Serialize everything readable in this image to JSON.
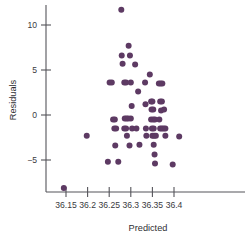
{
  "chart_data": {
    "type": "scatter",
    "title": "",
    "xlabel": "Predicted",
    "ylabel": "Residuals",
    "grid": false,
    "legend": false,
    "xlim": [
      36.13,
      36.45
    ],
    "ylim": [
      -9.0,
      12.8
    ],
    "xticks": [
      36.15,
      36.2,
      36.25,
      36.3,
      36.35,
      36.4
    ],
    "xticklabels": [
      "36.15",
      "36.2",
      "36.25",
      "36.3",
      "36.35",
      "36.4"
    ],
    "yticks": [
      10,
      5,
      0,
      -5
    ],
    "yticklabels": [
      "10",
      "5",
      "0",
      "-5"
    ],
    "marker_color": "#5d3a63",
    "marker_size": 3.0,
    "points": [
      {
        "x": 36.145,
        "y": -8.1
      },
      {
        "x": 36.198,
        "y": -2.3
      },
      {
        "x": 36.247,
        "y": -5.2
      },
      {
        "x": 36.251,
        "y": 3.6
      },
      {
        "x": 36.256,
        "y": 3.6
      },
      {
        "x": 36.259,
        "y": -0.5
      },
      {
        "x": 36.263,
        "y": -0.5
      },
      {
        "x": 36.262,
        "y": -1.5
      },
      {
        "x": 36.266,
        "y": -1.5
      },
      {
        "x": 36.264,
        "y": -3.4
      },
      {
        "x": 36.271,
        "y": -5.2
      },
      {
        "x": 36.278,
        "y": 11.7
      },
      {
        "x": 36.281,
        "y": 5.7
      },
      {
        "x": 36.279,
        "y": 6.6
      },
      {
        "x": 36.285,
        "y": 3.6
      },
      {
        "x": 36.289,
        "y": 3.6
      },
      {
        "x": 36.286,
        "y": -0.4
      },
      {
        "x": 36.29,
        "y": -0.4
      },
      {
        "x": 36.294,
        "y": -0.4
      },
      {
        "x": 36.285,
        "y": -1.5
      },
      {
        "x": 36.289,
        "y": -1.5
      },
      {
        "x": 36.291,
        "y": -2.3
      },
      {
        "x": 36.295,
        "y": 7.7
      },
      {
        "x": 36.298,
        "y": 6.6
      },
      {
        "x": 36.3,
        "y": 3.6
      },
      {
        "x": 36.302,
        "y": 1.0
      },
      {
        "x": 36.3,
        "y": -0.4
      },
      {
        "x": 36.303,
        "y": -1.5
      },
      {
        "x": 36.297,
        "y": -3.4
      },
      {
        "x": 36.31,
        "y": 5.6
      },
      {
        "x": 36.313,
        "y": -1.5
      },
      {
        "x": 36.317,
        "y": 2.6
      },
      {
        "x": 36.32,
        "y": -3.3
      },
      {
        "x": 36.333,
        "y": 3.6
      },
      {
        "x": 36.334,
        "y": 1.2
      },
      {
        "x": 36.335,
        "y": -1.5
      },
      {
        "x": 36.336,
        "y": -2.3
      },
      {
        "x": 36.344,
        "y": 4.5
      },
      {
        "x": 36.347,
        "y": 1.5
      },
      {
        "x": 36.35,
        "y": 1.5
      },
      {
        "x": 36.352,
        "y": 0.6
      },
      {
        "x": 36.348,
        "y": 0.6
      },
      {
        "x": 36.347,
        "y": -0.5
      },
      {
        "x": 36.352,
        "y": -0.5
      },
      {
        "x": 36.356,
        "y": -0.5
      },
      {
        "x": 36.349,
        "y": -1.5
      },
      {
        "x": 36.353,
        "y": -1.5
      },
      {
        "x": 36.35,
        "y": -2.3
      },
      {
        "x": 36.354,
        "y": -2.3
      },
      {
        "x": 36.358,
        "y": -2.3
      },
      {
        "x": 36.353,
        "y": -3.3
      },
      {
        "x": 36.355,
        "y": -4.4
      },
      {
        "x": 36.356,
        "y": -5.4
      },
      {
        "x": 36.365,
        "y": 3.5
      },
      {
        "x": 36.369,
        "y": 3.5
      },
      {
        "x": 36.373,
        "y": 3.5
      },
      {
        "x": 36.368,
        "y": 1.5
      },
      {
        "x": 36.372,
        "y": 1.5
      },
      {
        "x": 36.37,
        "y": 0.5
      },
      {
        "x": 36.366,
        "y": -0.5
      },
      {
        "x": 36.368,
        "y": -1.5
      },
      {
        "x": 36.372,
        "y": -1.5
      },
      {
        "x": 36.376,
        "y": -1.5
      },
      {
        "x": 36.38,
        "y": -1.5
      },
      {
        "x": 36.377,
        "y": 0.6
      },
      {
        "x": 36.38,
        "y": -2.3
      },
      {
        "x": 36.397,
        "y": -5.5
      },
      {
        "x": 36.412,
        "y": -2.4
      }
    ]
  },
  "axes": {
    "x_title": "Predicted",
    "y_title": "Residuals"
  }
}
